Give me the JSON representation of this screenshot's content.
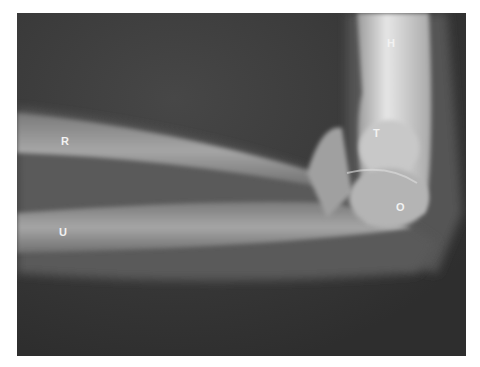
{
  "image": {
    "subject": "Lateral radiograph of flexed elbow",
    "labels": [
      {
        "id": "H",
        "text": "H",
        "x": 387,
        "y": 38
      },
      {
        "id": "T",
        "text": "T",
        "x": 373,
        "y": 128
      },
      {
        "id": "R",
        "text": "R",
        "x": 61,
        "y": 136
      },
      {
        "id": "O",
        "text": "O",
        "x": 396,
        "y": 202
      },
      {
        "id": "U",
        "text": "U",
        "x": 59,
        "y": 227
      }
    ],
    "colors": {
      "background": "#3a3a3a",
      "bone": "#bdbdbd",
      "label": "#f2f2f2",
      "page": "#ffffff"
    }
  }
}
